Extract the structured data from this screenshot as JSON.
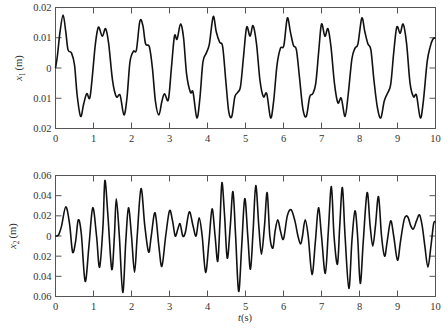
{
  "chart_data": [
    {
      "type": "line",
      "title": "",
      "xlabel": "",
      "ylabel": "x1 (m)",
      "ylabel_var": "x",
      "ylabel_sub": "1",
      "ylabel_unit": "(m)",
      "xlim": [
        0,
        10
      ],
      "ylim": [
        -0.02,
        0.02
      ],
      "xticks": [
        "0",
        "1",
        "2",
        "3",
        "4",
        "5",
        "6",
        "7",
        "8",
        "9",
        "10"
      ],
      "yticks": [
        "0.02",
        "0.01",
        "0",
        "0.01",
        "0.02"
      ],
      "grid": false,
      "series": [
        {
          "name": "x1",
          "points": [
            [
              0,
              0
            ],
            [
              0.05,
              0.004
            ],
            [
              0.12,
              0.012
            ],
            [
              0.2,
              0.0175
            ],
            [
              0.27,
              0.012
            ],
            [
              0.33,
              0.006
            ],
            [
              0.42,
              0.005
            ],
            [
              0.5,
              0.001
            ],
            [
              0.57,
              -0.009
            ],
            [
              0.66,
              -0.016
            ],
            [
              0.74,
              -0.012
            ],
            [
              0.82,
              -0.0085
            ],
            [
              0.9,
              -0.01
            ],
            [
              0.96,
              -0.004
            ],
            [
              1.05,
              0.008
            ],
            [
              1.13,
              0.0135
            ],
            [
              1.23,
              0.0105
            ],
            [
              1.32,
              0.013
            ],
            [
              1.4,
              0.008
            ],
            [
              1.5,
              -0.004
            ],
            [
              1.6,
              -0.0095
            ],
            [
              1.7,
              -0.009
            ],
            [
              1.8,
              -0.0155
            ],
            [
              1.88,
              -0.01
            ],
            [
              1.96,
              0.002
            ],
            [
              2.05,
              0.0055
            ],
            [
              2.13,
              0.006
            ],
            [
              2.22,
              0.0155
            ],
            [
              2.3,
              0.014
            ],
            [
              2.37,
              0.008
            ],
            [
              2.47,
              0.007
            ],
            [
              2.55,
              0.0
            ],
            [
              2.63,
              -0.011
            ],
            [
              2.72,
              -0.0155
            ],
            [
              2.8,
              -0.011
            ],
            [
              2.87,
              -0.0085
            ],
            [
              2.97,
              -0.0105
            ],
            [
              3.05,
              0.0
            ],
            [
              3.13,
              0.0105
            ],
            [
              3.2,
              0.0095
            ],
            [
              3.29,
              0.0145
            ],
            [
              3.37,
              0.01
            ],
            [
              3.45,
              -0.002
            ],
            [
              3.55,
              -0.008
            ],
            [
              3.62,
              -0.008
            ],
            [
              3.72,
              -0.0165
            ],
            [
              3.8,
              -0.01
            ],
            [
              3.88,
              0.002
            ],
            [
              3.97,
              0.005
            ],
            [
              4.05,
              0.008
            ],
            [
              4.15,
              0.017
            ],
            [
              4.23,
              0.012
            ],
            [
              4.32,
              0.0085
            ],
            [
              4.4,
              0.007
            ],
            [
              4.48,
              -0.004
            ],
            [
              4.56,
              -0.0145
            ],
            [
              4.64,
              -0.016
            ],
            [
              4.72,
              -0.0095
            ],
            [
              4.8,
              -0.008
            ],
            [
              4.87,
              -0.006
            ],
            [
              4.95,
              0.004
            ],
            [
              5.03,
              0.0135
            ],
            [
              5.12,
              0.0105
            ],
            [
              5.2,
              0.014
            ],
            [
              5.29,
              0.008
            ],
            [
              5.38,
              -0.004
            ],
            [
              5.47,
              -0.0095
            ],
            [
              5.56,
              -0.0085
            ],
            [
              5.66,
              -0.0165
            ],
            [
              5.74,
              -0.011
            ],
            [
              5.83,
              0.001
            ],
            [
              5.92,
              0.0065
            ],
            [
              6.01,
              0.0075
            ],
            [
              6.1,
              0.0165
            ],
            [
              6.18,
              0.012
            ],
            [
              6.26,
              0.0075
            ],
            [
              6.34,
              0.006
            ],
            [
              6.42,
              -0.003
            ],
            [
              6.51,
              -0.0135
            ],
            [
              6.6,
              -0.016
            ],
            [
              6.69,
              -0.0095
            ],
            [
              6.77,
              -0.0085
            ],
            [
              6.85,
              -0.005
            ],
            [
              6.93,
              0.006
            ],
            [
              7.0,
              0.0145
            ],
            [
              7.09,
              0.0105
            ],
            [
              7.17,
              0.013
            ],
            [
              7.25,
              0.007
            ],
            [
              7.34,
              -0.005
            ],
            [
              7.43,
              -0.0115
            ],
            [
              7.52,
              -0.01
            ],
            [
              7.62,
              -0.016
            ],
            [
              7.7,
              -0.009
            ],
            [
              7.8,
              0.003
            ],
            [
              7.88,
              0.0065
            ],
            [
              7.96,
              0.008
            ],
            [
              8.06,
              0.0165
            ],
            [
              8.14,
              0.012
            ],
            [
              8.22,
              0.008
            ],
            [
              8.3,
              0.006
            ],
            [
              8.38,
              -0.004
            ],
            [
              8.47,
              -0.013
            ],
            [
              8.56,
              -0.0165
            ],
            [
              8.65,
              -0.011
            ],
            [
              8.73,
              -0.0085
            ],
            [
              8.82,
              -0.0055
            ],
            [
              8.9,
              0.005
            ],
            [
              8.98,
              0.0135
            ],
            [
              9.07,
              0.0115
            ],
            [
              9.15,
              0.0145
            ],
            [
              9.24,
              0.008
            ],
            [
              9.33,
              -0.005
            ],
            [
              9.42,
              -0.0095
            ],
            [
              9.5,
              -0.009
            ],
            [
              9.6,
              -0.0165
            ],
            [
              9.68,
              -0.011
            ],
            [
              9.78,
              0.002
            ],
            [
              9.86,
              0.007
            ],
            [
              9.93,
              0.0095
            ],
            [
              10.0,
              0.01
            ]
          ]
        }
      ]
    },
    {
      "type": "line",
      "title": "",
      "xlabel": "t(s)",
      "xlabel_var": "t",
      "xlabel_unit": "(s)",
      "ylabel": "x2 (m)",
      "ylabel_var": "x",
      "ylabel_sub": "2",
      "ylabel_unit": "(m)",
      "xlim": [
        0,
        10
      ],
      "ylim": [
        -0.06,
        0.06
      ],
      "xticks": [
        "0",
        "1",
        "2",
        "3",
        "4",
        "5",
        "6",
        "7",
        "8",
        "9",
        "10"
      ],
      "yticks": [
        "0.06",
        "0.04",
        "0.02",
        "0",
        "0.02",
        "0.04",
        "0.06"
      ],
      "grid": false,
      "series": [
        {
          "name": "x2",
          "points": [
            [
              0,
              0
            ],
            [
              0.08,
              0.001
            ],
            [
              0.16,
              0.01
            ],
            [
              0.27,
              0.029
            ],
            [
              0.37,
              0.012
            ],
            [
              0.45,
              -0.016
            ],
            [
              0.53,
              -0.005
            ],
            [
              0.6,
              0.016
            ],
            [
              0.68,
              0.002
            ],
            [
              0.78,
              -0.045
            ],
            [
              0.88,
              -0.01
            ],
            [
              0.98,
              0.028
            ],
            [
              1.08,
              0.0
            ],
            [
              1.16,
              -0.031
            ],
            [
              1.25,
              0.01
            ],
            [
              1.3,
              0.055
            ],
            [
              1.38,
              0.02
            ],
            [
              1.48,
              -0.033
            ],
            [
              1.55,
              0.0
            ],
            [
              1.6,
              0.037
            ],
            [
              1.68,
              0.0
            ],
            [
              1.77,
              -0.056
            ],
            [
              1.85,
              -0.005
            ],
            [
              1.92,
              0.028
            ],
            [
              2.0,
              0.0
            ],
            [
              2.08,
              -0.036
            ],
            [
              2.15,
              0.0
            ],
            [
              2.25,
              0.047
            ],
            [
              2.35,
              0.01
            ],
            [
              2.45,
              -0.016
            ],
            [
              2.52,
              0.0
            ],
            [
              2.62,
              0.023
            ],
            [
              2.72,
              -0.01
            ],
            [
              2.8,
              -0.03
            ],
            [
              2.9,
              0.0
            ],
            [
              3.0,
              0.025
            ],
            [
              3.08,
              0.015
            ],
            [
              3.15,
              0.0
            ],
            [
              3.22,
              0.007
            ],
            [
              3.28,
              0.012
            ],
            [
              3.35,
              0.0
            ],
            [
              3.42,
              0.004
            ],
            [
              3.52,
              0.024
            ],
            [
              3.62,
              0.01
            ],
            [
              3.7,
              0.0
            ],
            [
              3.78,
              0.018
            ],
            [
              3.86,
              0.0
            ],
            [
              3.95,
              -0.036
            ],
            [
              4.04,
              -0.005
            ],
            [
              4.12,
              0.027
            ],
            [
              4.2,
              0.0
            ],
            [
              4.27,
              -0.025
            ],
            [
              4.33,
              0.015
            ],
            [
              4.38,
              0.053
            ],
            [
              4.45,
              0.02
            ],
            [
              4.52,
              -0.022
            ],
            [
              4.6,
              0.01
            ],
            [
              4.67,
              0.044
            ],
            [
              4.74,
              0.0
            ],
            [
              4.82,
              -0.055
            ],
            [
              4.9,
              -0.01
            ],
            [
              4.98,
              0.037
            ],
            [
              5.06,
              0.0
            ],
            [
              5.13,
              -0.033
            ],
            [
              5.2,
              0.005
            ],
            [
              5.27,
              0.05
            ],
            [
              5.35,
              0.01
            ],
            [
              5.42,
              -0.018
            ],
            [
              5.5,
              0.01
            ],
            [
              5.57,
              0.043
            ],
            [
              5.64,
              0.0
            ],
            [
              5.72,
              -0.012
            ],
            [
              5.78,
              0.005
            ],
            [
              5.85,
              0.016
            ],
            [
              5.92,
              0.005
            ],
            [
              6.0,
              -0.003
            ],
            [
              6.1,
              0.02
            ],
            [
              6.2,
              0.026
            ],
            [
              6.3,
              0.015
            ],
            [
              6.38,
              0.0
            ],
            [
              6.45,
              -0.008
            ],
            [
              6.5,
              0.0
            ],
            [
              6.57,
              0.016
            ],
            [
              6.65,
              0.0
            ],
            [
              6.75,
              -0.038
            ],
            [
              6.84,
              -0.005
            ],
            [
              6.92,
              0.028
            ],
            [
              7.0,
              0.0
            ],
            [
              7.1,
              -0.037
            ],
            [
              7.18,
              0.005
            ],
            [
              7.26,
              0.049
            ],
            [
              7.33,
              0.0
            ],
            [
              7.42,
              -0.028
            ],
            [
              7.48,
              0.01
            ],
            [
              7.55,
              0.048
            ],
            [
              7.62,
              0.0
            ],
            [
              7.72,
              -0.052
            ],
            [
              7.8,
              -0.005
            ],
            [
              7.88,
              0.025
            ],
            [
              7.95,
              0.0
            ],
            [
              8.02,
              -0.047
            ],
            [
              8.1,
              -0.005
            ],
            [
              8.2,
              0.043
            ],
            [
              8.28,
              0.01
            ],
            [
              8.35,
              -0.01
            ],
            [
              8.42,
              0.01
            ],
            [
              8.5,
              0.039
            ],
            [
              8.58,
              0.0
            ],
            [
              8.66,
              -0.02
            ],
            [
              8.73,
              -0.005
            ],
            [
              8.82,
              0.015
            ],
            [
              8.9,
              0.0
            ],
            [
              9.0,
              -0.024
            ],
            [
              9.08,
              -0.005
            ],
            [
              9.18,
              0.017
            ],
            [
              9.27,
              0.019
            ],
            [
              9.35,
              0.01
            ],
            [
              9.42,
              0.007
            ],
            [
              9.5,
              0.015
            ],
            [
              9.58,
              0.021
            ],
            [
              9.65,
              0.01
            ],
            [
              9.72,
              -0.01
            ],
            [
              9.8,
              -0.031
            ],
            [
              9.88,
              -0.01
            ],
            [
              9.95,
              0.012
            ],
            [
              10.0,
              0.014
            ]
          ]
        }
      ]
    }
  ],
  "colors": {
    "line": "#111111",
    "axis": "#555555",
    "text": "#333333",
    "background": "#ffffff"
  }
}
